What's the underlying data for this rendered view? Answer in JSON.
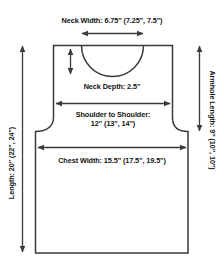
{
  "diagram": {
    "shape_name": "tank-top-outline",
    "line_color": "#3a3a3a",
    "text_color": "#141414",
    "background_color": "#ffffff",
    "labels": {
      "neck_width": "Neck Width: 6.75\" (7.25\", 7.5\")",
      "neck_depth": "Neck Depth: 2.5\"",
      "shoulder_line1": "Shoulder to Shoulder:",
      "shoulder_line2": "12\" (13\", 14\")",
      "chest_width": "Chest Width: 15.5\" (17.5\", 19.5\")",
      "length": "Length: 20\" (22\", 24\")",
      "armhole_length": "Armhole Length: 9\" (10\", 10\")"
    },
    "measurements": [
      {
        "name": "neck-width",
        "label": "Neck Width",
        "base": "6.75\"",
        "alternates": [
          "7.25\"",
          "7.5\""
        ],
        "unit": "inches",
        "orientation": "horizontal"
      },
      {
        "name": "neck-depth",
        "label": "Neck Depth",
        "base": "2.5\"",
        "alternates": [],
        "unit": "inches",
        "orientation": "vertical"
      },
      {
        "name": "shoulder-to-shoulder",
        "label": "Shoulder to Shoulder",
        "base": "12\"",
        "alternates": [
          "13\"",
          "14\""
        ],
        "unit": "inches",
        "orientation": "horizontal"
      },
      {
        "name": "chest-width",
        "label": "Chest Width",
        "base": "15.5\"",
        "alternates": [
          "17.5\"",
          "19.5\""
        ],
        "unit": "inches",
        "orientation": "horizontal"
      },
      {
        "name": "length",
        "label": "Length",
        "base": "20\"",
        "alternates": [
          "22\"",
          "24\""
        ],
        "unit": "inches",
        "orientation": "vertical"
      },
      {
        "name": "armhole-length",
        "label": "Armhole Length",
        "base": "9\"",
        "alternates": [
          "10\"",
          "10\""
        ],
        "unit": "inches",
        "orientation": "vertical"
      }
    ]
  }
}
